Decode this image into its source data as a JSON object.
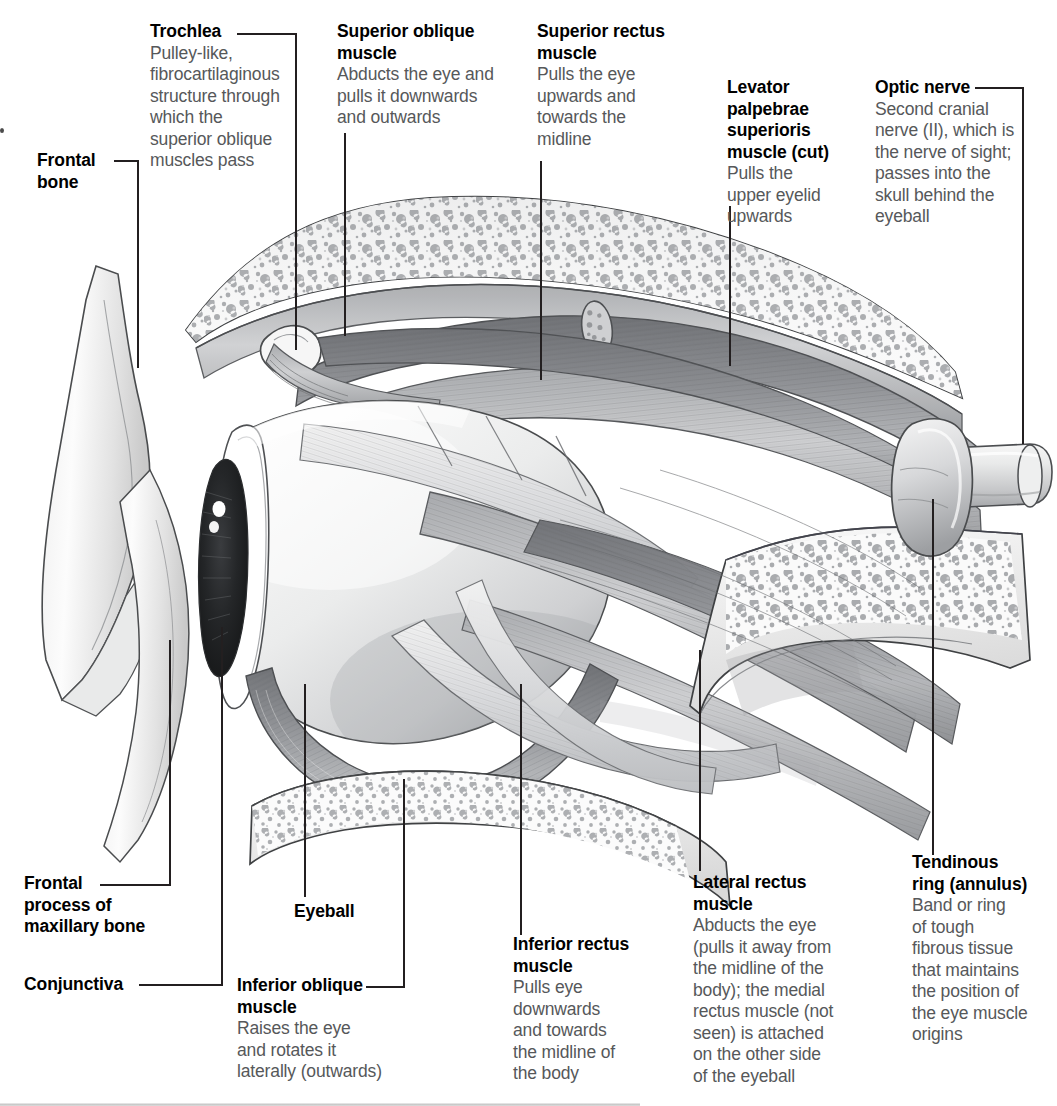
{
  "figure": {
    "text_color_heading": "#000000",
    "text_color_body": "#56585a",
    "background": "#ffffff"
  },
  "labels": [
    {
      "id": "trochlea",
      "heading": "Trochlea",
      "body": "Pulley-like,\nfibrocartilaginous\nstructure through\nwhich the\nsuperior oblique\nmuscles pass"
    },
    {
      "id": "superior-oblique-muscle",
      "heading": "Superior oblique\nmuscle",
      "body": "Abducts the eye and\npulls it downwards\nand outwards"
    },
    {
      "id": "superior-rectus-muscle",
      "heading": "Superior rectus\nmuscle",
      "body": "Pulls the eye\nupwards and\ntowards the\nmidline"
    },
    {
      "id": "levator-palpebrae-superioris-muscle",
      "heading": "Levator\npalpebrae\nsuperioris\nmuscle (cut)",
      "body": "Pulls the\nupper eyelid\nupwards"
    },
    {
      "id": "optic-nerve",
      "heading": "Optic nerve",
      "body": "Second cranial\nnerve (II), which is\nthe nerve of sight;\npasses into the\nskull behind the\neyeball"
    },
    {
      "id": "frontal-bone",
      "heading": "Frontal\nbone",
      "body": ""
    },
    {
      "id": "frontal-process-of-maxillary-bone",
      "heading": "Frontal\nprocess of\nmaxillary bone",
      "body": ""
    },
    {
      "id": "conjunctiva",
      "heading": "Conjunctiva",
      "body": ""
    },
    {
      "id": "eyeball",
      "heading": "Eyeball",
      "body": ""
    },
    {
      "id": "inferior-oblique-muscle",
      "heading": "Inferior oblique\nmuscle",
      "body": "Raises the eye\nand rotates it\nlaterally (outwards)"
    },
    {
      "id": "inferior-rectus-muscle",
      "heading": "Inferior rectus\nmuscle",
      "body": "Pulls eye\ndownwards\nand towards\nthe midline of\nthe body"
    },
    {
      "id": "lateral-rectus-muscle",
      "heading": "Lateral rectus\nmuscle",
      "body": "Abducts the eye\n(pulls it away from\nthe midline of the\nbody); the medial\nrectus muscle (not\nseen) is attached\non the other side\nof the eyeball"
    },
    {
      "id": "tendinous-ring-annulus",
      "heading": "Tendinous\nring (annulus)",
      "body": "Band or ring\nof tough\nfibrous tissue\nthat maintains\nthe position of\nthe eye muscle\norigins"
    }
  ]
}
